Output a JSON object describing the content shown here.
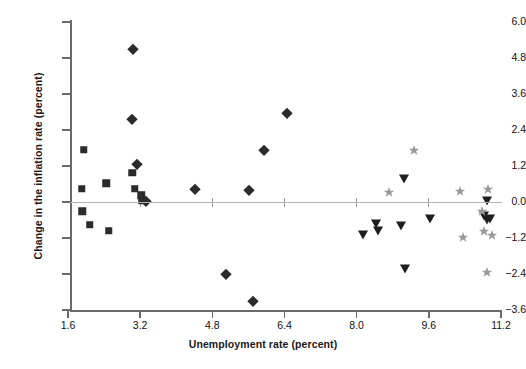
{
  "chart_data": {
    "type": "scatter",
    "title": "",
    "xlabel": "Unemployment rate (percent)",
    "ylabel": "Change in the inflation rate (percent)",
    "xlim": [
      1.2,
      11.8
    ],
    "ylim": [
      -3.9,
      6.2
    ],
    "xticks": [
      1.6,
      3.2,
      4.8,
      6.4,
      8.0,
      9.6,
      11.2
    ],
    "xtick_labels": [
      "1.6",
      "3.2",
      "4.8",
      "6.4",
      "8.0",
      "9.6",
      "11.2"
    ],
    "yticks": [
      6.0,
      4.8,
      3.6,
      2.4,
      1.2,
      0.0,
      -1.2,
      -2.4,
      -3.6
    ],
    "ytick_labels": [
      "6.0",
      "4.8",
      "3.6",
      "2.4",
      "1.2",
      "0.0",
      "−1.2",
      "−2.4",
      "−3.6"
    ],
    "grid": false,
    "legend": "none",
    "zero_line": true,
    "marker_colors": {
      "square": "#2b2b2b",
      "diamond": "#2b2b2b",
      "triangle": "#1f1f1f",
      "star": "#9a9a9a"
    },
    "series": [
      {
        "name": "squares",
        "marker": "square",
        "color": "#2b2b2b",
        "points": [
          {
            "x": 1.95,
            "y": 1.75
          },
          {
            "x": 1.9,
            "y": 0.45
          },
          {
            "x": 1.92,
            "y": -0.3
          },
          {
            "x": 2.08,
            "y": -0.75
          },
          {
            "x": 2.45,
            "y": 0.62
          },
          {
            "x": 2.5,
            "y": -0.95
          },
          {
            "x": 3.02,
            "y": 0.98
          },
          {
            "x": 3.08,
            "y": 0.45
          },
          {
            "x": 3.22,
            "y": 0.22
          },
          {
            "x": 3.25,
            "y": 0.05
          }
        ]
      },
      {
        "name": "diamonds",
        "marker": "diamond",
        "color": "#2b2b2b",
        "points": [
          {
            "x": 3.05,
            "y": 5.1
          },
          {
            "x": 3.03,
            "y": 2.78
          },
          {
            "x": 3.12,
            "y": 1.28
          },
          {
            "x": 3.32,
            "y": 0.02
          },
          {
            "x": 4.42,
            "y": 0.42
          },
          {
            "x": 5.1,
            "y": -2.4
          },
          {
            "x": 5.62,
            "y": 0.4
          },
          {
            "x": 5.7,
            "y": -3.3
          },
          {
            "x": 5.95,
            "y": 1.72
          },
          {
            "x": 6.45,
            "y": 2.98
          }
        ]
      },
      {
        "name": "triangles",
        "marker": "triangle",
        "color": "#1f1f1f",
        "points": [
          {
            "x": 8.15,
            "y": -1.1
          },
          {
            "x": 8.42,
            "y": -0.72
          },
          {
            "x": 8.48,
            "y": -0.95
          },
          {
            "x": 8.98,
            "y": -0.8
          },
          {
            "x": 9.05,
            "y": 0.78
          },
          {
            "x": 9.08,
            "y": -2.22
          },
          {
            "x": 9.62,
            "y": -0.55
          },
          {
            "x": 10.9,
            "y": 0.05
          },
          {
            "x": 10.82,
            "y": -0.48
          },
          {
            "x": 10.88,
            "y": -0.6
          },
          {
            "x": 10.95,
            "y": -0.55
          }
        ]
      },
      {
        "name": "stars",
        "marker": "star",
        "color": "#9a9a9a",
        "points": [
          {
            "x": 9.28,
            "y": 1.72
          },
          {
            "x": 8.72,
            "y": 0.32
          },
          {
            "x": 10.28,
            "y": 0.38
          },
          {
            "x": 10.92,
            "y": 0.42
          },
          {
            "x": 10.78,
            "y": -0.3
          },
          {
            "x": 10.82,
            "y": -0.95
          },
          {
            "x": 10.35,
            "y": -1.18
          },
          {
            "x": 11.0,
            "y": -1.1
          },
          {
            "x": 10.88,
            "y": -2.32
          }
        ]
      }
    ]
  }
}
